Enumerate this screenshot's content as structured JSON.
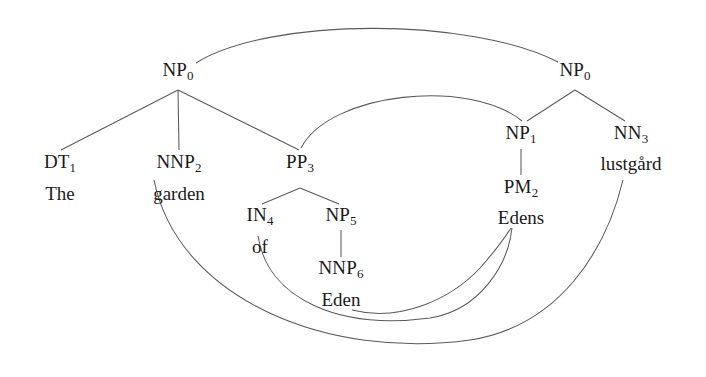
{
  "figure": {
    "type": "word-alignment-parse-tree",
    "width": 706,
    "height": 377,
    "background_color": "#ffffff",
    "line_color": "#5a5a5a",
    "text_color": "#1a1a1a"
  },
  "trees": {
    "source": {
      "language_side": "left",
      "sentence": "The garden of Eden",
      "nodes": [
        {
          "id": "s0",
          "label": "NP",
          "index": "0",
          "x": 178,
          "y": 71
        },
        {
          "id": "s1",
          "label": "DT",
          "index": "1",
          "x": 60,
          "y": 163
        },
        {
          "id": "s2",
          "label": "NNP",
          "index": "2",
          "x": 179,
          "y": 163
        },
        {
          "id": "s3",
          "label": "PP",
          "index": "3",
          "x": 300,
          "y": 163
        },
        {
          "id": "s4",
          "label": "IN",
          "index": "4",
          "x": 260,
          "y": 216
        },
        {
          "id": "s5",
          "label": "NP",
          "index": "5",
          "x": 341,
          "y": 216
        },
        {
          "id": "s6",
          "label": "NNP",
          "index": "6",
          "x": 341,
          "y": 269
        }
      ],
      "words": [
        {
          "id": "w1",
          "text": "The",
          "x": 60,
          "y": 193,
          "parent": "s1"
        },
        {
          "id": "w2",
          "text": "garden",
          "x": 179,
          "y": 193,
          "parent": "s2"
        },
        {
          "id": "w4",
          "text": "of",
          "x": 260,
          "y": 246,
          "parent": "s4"
        },
        {
          "id": "w6",
          "text": "Eden",
          "x": 341,
          "y": 299,
          "parent": "s6"
        }
      ]
    },
    "target": {
      "language_side": "right",
      "sentence": "Edens lustgård",
      "nodes": [
        {
          "id": "t0",
          "label": "NP",
          "index": "0",
          "x": 575,
          "y": 71
        },
        {
          "id": "t1",
          "label": "NP",
          "index": "1",
          "x": 521,
          "y": 134
        },
        {
          "id": "t2",
          "label": "PM",
          "index": "2",
          "x": 521,
          "y": 188
        },
        {
          "id": "t3",
          "label": "NN",
          "index": "3",
          "x": 631,
          "y": 134
        }
      ],
      "words": [
        {
          "id": "tw2",
          "text": "Edens",
          "x": 521,
          "y": 217,
          "parent": "t2"
        },
        {
          "id": "tw3",
          "text": "lustgård",
          "x": 631,
          "y": 163,
          "parent": "t3"
        }
      ]
    }
  },
  "alignment_links": [
    {
      "from": "NP0",
      "to": "NP0",
      "kind": "phrase"
    },
    {
      "from": "PP3",
      "to": "NP1",
      "kind": "phrase"
    },
    {
      "from": "garden",
      "to": "lustgård",
      "kind": "word"
    },
    {
      "from": "of",
      "to": "Edens",
      "kind": "word"
    },
    {
      "from": "Eden",
      "to": "Edens",
      "kind": "word"
    }
  ]
}
